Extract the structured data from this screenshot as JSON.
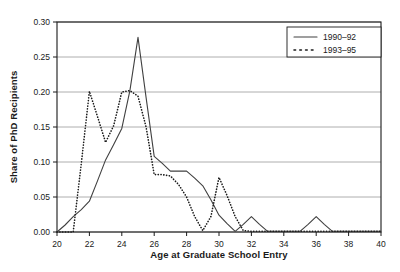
{
  "chart_data": {
    "type": "line",
    "title": "",
    "xlabel": "Age at Graduate School Entry",
    "ylabel": "Share of PhD Recipients",
    "xlim": [
      20,
      40
    ],
    "ylim": [
      0.0,
      0.3
    ],
    "xticks": [
      20,
      22,
      24,
      26,
      28,
      30,
      32,
      34,
      36,
      38,
      40
    ],
    "xtick_labels": [
      "20",
      "22",
      "24",
      "26",
      "28",
      "30",
      "32",
      "34",
      "36",
      "38",
      "40"
    ],
    "yticks": [
      0.0,
      0.05,
      0.1,
      0.15,
      0.2,
      0.25,
      0.3
    ],
    "ytick_labels": [
      "0.00",
      "0.05",
      "0.10",
      "0.15",
      "0.20",
      "0.25",
      "0.30"
    ],
    "grid": "horizontal",
    "legend_position": "top-right",
    "x": [
      20,
      20.5,
      21,
      21.5,
      22,
      22.5,
      23,
      23.5,
      24,
      24.5,
      25,
      25.5,
      26,
      26.5,
      27,
      27.5,
      28,
      28.5,
      29,
      29.5,
      30,
      30.5,
      31,
      31.5,
      32,
      32.5,
      33,
      33.5,
      34,
      34.5,
      35,
      35.5,
      36,
      36.5,
      37,
      37.5,
      38,
      38.5,
      39,
      39.5,
      40
    ],
    "series": [
      {
        "name": "1990-92",
        "style": "solid",
        "color": "#404040",
        "values": [
          0.0,
          0.01,
          0.022,
          0.032,
          0.044,
          0.073,
          0.103,
          0.125,
          0.148,
          0.202,
          0.278,
          0.192,
          0.108,
          0.098,
          0.087,
          0.087,
          0.087,
          0.077,
          0.066,
          0.046,
          0.024,
          0.012,
          0.001,
          0.011,
          0.022,
          0.011,
          0.001,
          0.001,
          0.001,
          0.001,
          0.001,
          0.011,
          0.022,
          0.011,
          0.001,
          0.001,
          0.001,
          0.001,
          0.001,
          0.001,
          0.001
        ]
      },
      {
        "name": "1993-95",
        "style": "dotted",
        "color": "#1a1a1a",
        "values": [
          0.0,
          0.0,
          0.0,
          0.098,
          0.201,
          0.165,
          0.128,
          0.152,
          0.2,
          0.202,
          0.194,
          0.15,
          0.082,
          0.082,
          0.08,
          0.068,
          0.05,
          0.022,
          0.002,
          0.022,
          0.078,
          0.052,
          0.022,
          0.002,
          0.001,
          0.001,
          0.001,
          0.001,
          0.001,
          0.001,
          0.001,
          0.001,
          0.001,
          0.001,
          0.001,
          0.001,
          0.001,
          0.001,
          0.001,
          0.001,
          0.001
        ]
      }
    ],
    "legend": [
      {
        "label": "1990–92",
        "style": "solid"
      },
      {
        "label": "1993–95",
        "style": "dotted"
      }
    ]
  }
}
